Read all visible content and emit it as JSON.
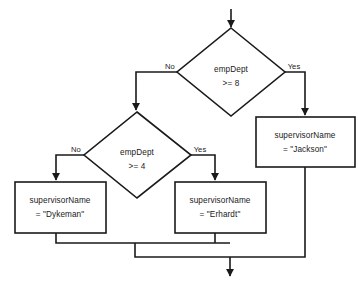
{
  "diagram": {
    "type": "flowchart",
    "background_color": "#ffffff",
    "line_color": "#1a1a1a",
    "text_color": "#1a1a1a"
  },
  "nodes": {
    "start_arrow": {
      "name": "start-arrow",
      "label": ""
    },
    "decision_1": {
      "shape": "diamond",
      "line1": "empDept",
      "line2": ">= 8",
      "center_x": 231,
      "center_y": 72
    },
    "decision_2": {
      "shape": "diamond",
      "line1": "empDept",
      "line2": ">= 4",
      "center_x": 137,
      "center_y": 155
    },
    "process_jackson": {
      "shape": "rectangle",
      "line1": "supervisorName",
      "line2": "= \"Jackson\"",
      "center_x": 305,
      "center_y": 142
    },
    "process_erhardt": {
      "shape": "rectangle",
      "line1": "supervisorName",
      "line2": "= \"Erhardt\"",
      "center_x": 220,
      "center_y": 207
    },
    "process_dykeman": {
      "shape": "rectangle",
      "line1": "supervisorName",
      "line2": "= \"Dykeman\"",
      "center_x": 60,
      "center_y": 207
    },
    "end_arrow": {
      "name": "end-arrow",
      "label": ""
    }
  },
  "edge_labels": {
    "d1_no": "No",
    "d1_yes": "Yes",
    "d2_no": "No",
    "d2_yes": "Yes"
  }
}
